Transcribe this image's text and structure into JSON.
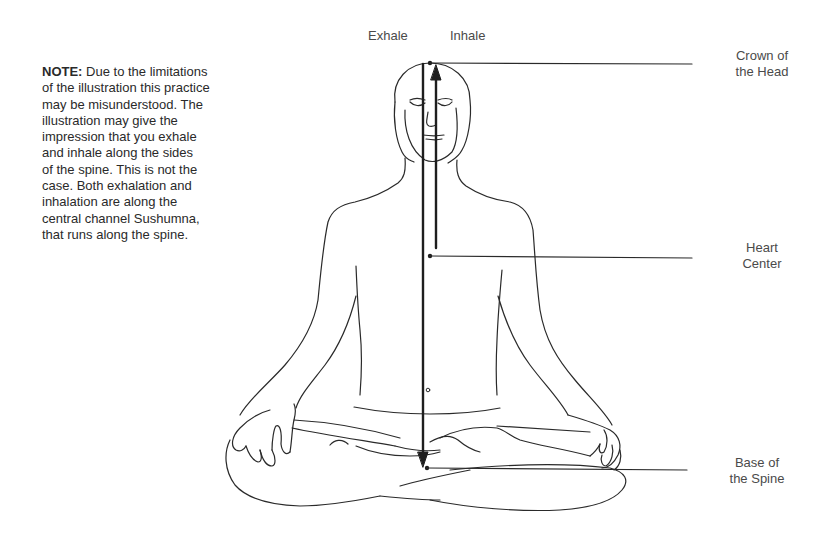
{
  "flow_labels": {
    "exhale": "Exhale",
    "inhale": "Inhale"
  },
  "note": {
    "heading": "NOTE:",
    "lines": [
      " Due to the limitations",
      "of the illustration this practice",
      "may be misunderstood. The",
      "illustration may give the",
      "impression that you exhale",
      "and inhale along the sides",
      "of the spine. This is not the",
      "case. Both exhalation and",
      "inhalation are along the",
      "central channel Sushumna,",
      "that runs along the spine."
    ]
  },
  "points": [
    {
      "id": "crown",
      "line1": "Crown of",
      "line2": "the Head"
    },
    {
      "id": "heart",
      "line1": "Heart",
      "line2": "Center"
    },
    {
      "id": "base",
      "line1": "Base of",
      "line2": "the Spine"
    }
  ],
  "colors": {
    "line": "#222222",
    "label_text": "#4a4a4a",
    "note_text": "#2a2a2a"
  }
}
